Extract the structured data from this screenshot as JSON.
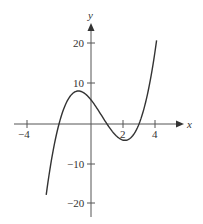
{
  "chart_data": {
    "type": "line",
    "title": "",
    "xlabel": "x",
    "ylabel": "y",
    "xlim": [
      -5,
      5
    ],
    "ylim": [
      -24,
      27
    ],
    "x_ticks": [
      -4,
      2,
      4
    ],
    "x_tick_labels": [
      "−4",
      "2",
      "4"
    ],
    "y_ticks": [
      20,
      10,
      -10,
      -20
    ],
    "y_tick_labels": [
      "20",
      "10",
      "−10",
      "−20"
    ],
    "grid": false,
    "legend": null,
    "series": [
      {
        "name": "f(x)",
        "description": "cubic with roots near x = -2, 1, 3; local max about (-0.8, 8), local min about (2.1, -4)",
        "x": [
          -2.8,
          -2.5,
          -2,
          -1.5,
          -1,
          -0.8,
          -0.5,
          0,
          0.5,
          1,
          1.5,
          2,
          2.1,
          2.5,
          3,
          3.5,
          4,
          4.1
        ],
        "y": [
          -17.6,
          -10.1,
          0,
          5.6,
          8,
          8.2,
          7.9,
          6,
          3.1,
          0,
          -2.6,
          -4,
          -4.1,
          -3.4,
          0,
          6.9,
          18,
          19.6
        ]
      }
    ],
    "colors": {
      "curve": "#333333",
      "axes": "#555555"
    }
  }
}
